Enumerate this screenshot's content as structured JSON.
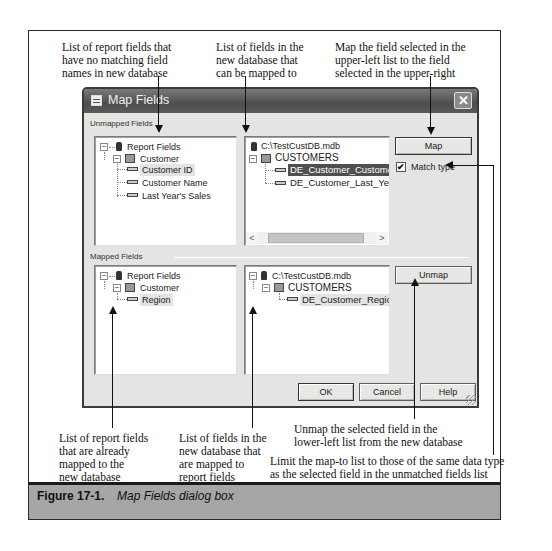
{
  "annotations": {
    "top_left": [
      "List of report fields that",
      "have no matching field",
      "names in new database"
    ],
    "top_middle": [
      "List of fields in the",
      "new database that",
      "can be mapped to"
    ],
    "top_right": [
      "Map the field selected in the",
      "upper-left list to the field",
      "selected in the upper-right"
    ],
    "bottom_left": [
      "List of report fields",
      "that are already",
      "mapped to the",
      "new database"
    ],
    "bottom_middle": [
      "List of fields in the",
      "new database that",
      "are mapped to",
      "report fields"
    ],
    "bottom_right_unmap": [
      "Unmap the selected field in the",
      "lower-left list from the new database"
    ],
    "bottom_right_match": [
      "Limit the map-to list to those of the same data type",
      "as the selected field in the unmatched fields list"
    ]
  },
  "dialog": {
    "title": "Map Fields",
    "close_glyph": "✕",
    "unmapped_section": {
      "label": "Unmapped Fields",
      "report_tree": {
        "root": "Report Fields",
        "table": "Customer",
        "fields": [
          "Customer ID",
          "Customer Name",
          "Last Year's Sales"
        ],
        "selected": "Customer ID"
      },
      "database_tree": {
        "root": "C:\\TestCustDB.mdb",
        "table": "CUSTOMERS",
        "fields": [
          "DE_Customer_Customer_ID",
          "DE_Customer_Last_Years_S"
        ],
        "selected": "DE_Customer_Customer_ID",
        "scroll_left": "<",
        "scroll_right": ">"
      }
    },
    "mapped_section": {
      "label": "Mapped Fields",
      "report_tree": {
        "root": "Report Fields",
        "table": "Customer",
        "fields": [
          "Region"
        ],
        "selected": "Region"
      },
      "database_tree": {
        "root": "C:\\TestCustDB.mdb",
        "table": "CUSTOMERS",
        "fields": [
          "DE_Customer_Region"
        ],
        "selected": "DE_Customer_Region"
      }
    },
    "buttons": {
      "map": "Map",
      "unmap": "Unmap",
      "ok": "OK",
      "cancel": "Cancel",
      "help": "Help"
    },
    "match_type": {
      "label": "Match type",
      "checked": true,
      "check_glyph": "✔"
    },
    "expander_glyph": "−"
  },
  "caption": {
    "label": "Figure 17-1.",
    "title": "Map Fields dialog box"
  }
}
